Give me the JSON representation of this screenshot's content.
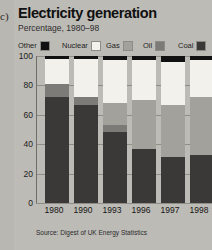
{
  "figure": {
    "panel_letter": "c)",
    "title": "Electricity generation",
    "subtitle": "Percentage, 1980–98",
    "source": "Source: Digest of UK Energy Statistics"
  },
  "legend": {
    "items": [
      {
        "label": "Other",
        "color": "#111111"
      },
      {
        "label": "Nuclear",
        "color": "#f2f1ec"
      },
      {
        "label": "Gas",
        "color": "#a3a19c"
      },
      {
        "label": "Oil",
        "color": "#7d7b77"
      },
      {
        "label": "Coal",
        "color": "#3a3937"
      }
    ]
  },
  "chart_data": {
    "type": "bar",
    "title": "Electricity generation",
    "subtitle": "Percentage, 1980–98",
    "xlabel": "",
    "ylabel": "Percentage",
    "ylim": [
      0,
      100
    ],
    "yticks": [
      0,
      20,
      40,
      60,
      80,
      100
    ],
    "ytick_labels": [
      "0",
      "20",
      "40",
      "60",
      "80",
      "100"
    ],
    "grid": true,
    "stacked": true,
    "legend_position": "top",
    "categories": [
      "1980",
      "1990",
      "1993",
      "1996",
      "1997",
      "1998"
    ],
    "series": [
      {
        "name": "Coal",
        "color": "#3a3937",
        "values": [
          72,
          67,
          48,
          37,
          31,
          33
        ]
      },
      {
        "name": "Oil",
        "color": "#7d7b77",
        "values": [
          9,
          5,
          5,
          0,
          0,
          0
        ]
      },
      {
        "name": "Gas",
        "color": "#a3a19c",
        "values": [
          0,
          0,
          15,
          33,
          36,
          39
        ]
      },
      {
        "name": "Nuclear",
        "color": "#f2f1ec",
        "values": [
          17,
          26,
          29,
          27,
          29,
          25
        ]
      },
      {
        "name": "Other",
        "color": "#111111",
        "values": [
          2,
          2,
          3,
          3,
          4,
          3
        ]
      }
    ]
  }
}
